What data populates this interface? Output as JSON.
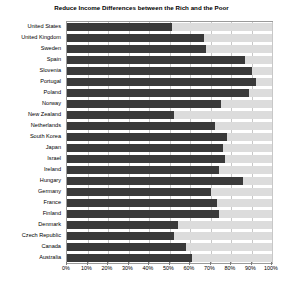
{
  "chart_data": {
    "type": "bar",
    "orientation": "horizontal",
    "title": "Reduce Income Differences between the Rich and the Poor",
    "xlabel": "",
    "ylabel": "",
    "xlim": [
      0,
      100
    ],
    "grid": true,
    "legend": "none",
    "stacked": true,
    "xtick_labels": [
      "0%",
      "10%",
      "20%",
      "30%",
      "40%",
      "50%",
      "60%",
      "70%",
      "80%",
      "90%",
      "100%"
    ],
    "xtick_values": [
      0,
      10,
      20,
      30,
      40,
      50,
      60,
      70,
      80,
      90,
      100
    ],
    "categories": [
      "United States",
      "United Kingdom",
      "Sweden",
      "Spain",
      "Slovenia",
      "Portugal",
      "Poland",
      "Norway",
      "New Zealand",
      "Netherlands",
      "South Korea",
      "Japan",
      "Israel",
      "Ireland",
      "Hungary",
      "Germany",
      "France",
      "Finland",
      "Denmark",
      "Czech Republic",
      "Canada",
      "Australia"
    ],
    "series": [
      {
        "name": "Agree",
        "color": "#3a3a3a",
        "values": [
          51,
          67,
          68,
          87,
          90,
          92,
          89,
          75,
          52,
          72,
          78,
          76,
          77,
          74,
          86,
          70,
          73,
          74,
          54,
          52,
          58,
          61
        ]
      },
      {
        "name": "Remainder",
        "color": "#dcdcdc",
        "values": [
          49,
          33,
          32,
          13,
          10,
          8,
          11,
          25,
          48,
          28,
          22,
          24,
          23,
          26,
          14,
          30,
          27,
          26,
          46,
          48,
          42,
          39
        ]
      }
    ],
    "colors": {
      "bar_dark": "#3a3a3a",
      "bar_light": "#dcdcdc",
      "gridline": "#c8c8c8",
      "frame": "#9a9a9a",
      "background": "#ffffff",
      "text": "#000000"
    }
  }
}
